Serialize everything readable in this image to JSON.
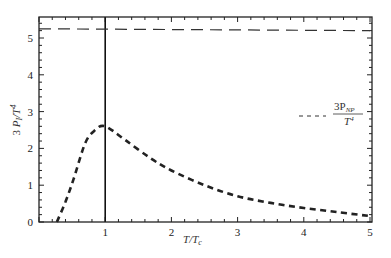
{
  "chart_data": {
    "type": "line",
    "title": "",
    "xlabel": "T/T_c",
    "ylabel": "3 P_I / T^4",
    "xlim": [
      0,
      5
    ],
    "ylim": [
      0,
      5.5
    ],
    "xticks": [
      1,
      2,
      3,
      4,
      5
    ],
    "yticks": [
      0,
      1,
      2,
      3,
      4,
      5
    ],
    "grid": false,
    "legend_position": "right-middle",
    "series": [
      {
        "name": "3 P_I / T^4",
        "style": "dashed-bold",
        "x": [
          0.27,
          0.4,
          0.52,
          0.7,
          0.85,
          1.0,
          1.3,
          1.68,
          2.0,
          2.5,
          3.0,
          3.5,
          4.0,
          4.5,
          5.0
        ],
        "y": [
          0.0,
          0.55,
          1.15,
          2.15,
          2.5,
          2.6,
          2.23,
          1.74,
          1.4,
          1.0,
          0.7,
          0.52,
          0.38,
          0.27,
          0.16
        ]
      },
      {
        "name": "3 P_NP / T^4",
        "style": "dashed-long",
        "x": [
          0,
          5
        ],
        "y": [
          5.25,
          5.2
        ]
      }
    ],
    "annotations": [
      {
        "type": "vertical-line",
        "x": 1.0,
        "style": "solid"
      }
    ],
    "legend": {
      "entries": [
        {
          "label_num": "3P",
          "label_sub": "NP",
          "label_den": "T",
          "label_den_sup": "4",
          "style": "dashed"
        }
      ]
    },
    "tick_labels": {
      "x": [
        "1",
        "2",
        "3",
        "4",
        "5"
      ],
      "y": [
        "0",
        "1",
        "2",
        "3",
        "4",
        "5"
      ]
    }
  }
}
